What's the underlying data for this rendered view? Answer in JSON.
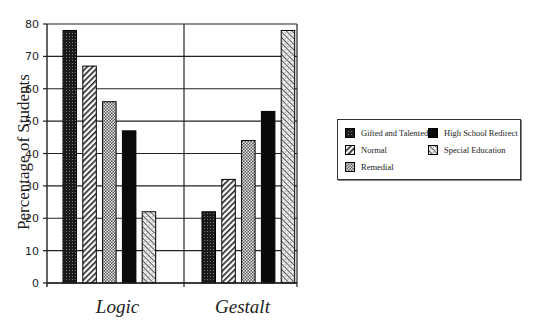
{
  "chart_data": {
    "type": "bar",
    "title": "",
    "xlabel": "",
    "ylabel": "Percentage of Students",
    "ylim": [
      0,
      80
    ],
    "yticks": [
      0,
      10,
      20,
      30,
      40,
      50,
      60,
      70,
      80
    ],
    "grid": true,
    "legend_position": "right",
    "categories": [
      "Logic",
      "Gestalt"
    ],
    "series": [
      {
        "name": "Gifted and Talented",
        "values": [
          78,
          22
        ],
        "pattern": "dark-dots"
      },
      {
        "name": "Normal",
        "values": [
          67,
          32
        ],
        "pattern": "diagonal-stripes"
      },
      {
        "name": "Remedial",
        "values": [
          56,
          44
        ],
        "pattern": "checker"
      },
      {
        "name": "High School Redirect",
        "values": [
          47,
          53
        ],
        "pattern": "solid-black"
      },
      {
        "name": "Special Education",
        "values": [
          22,
          78
        ],
        "pattern": "light-diagonal"
      }
    ]
  },
  "legend": {
    "items": [
      {
        "label": "Gifted and Talented",
        "pattern": "dark-dots"
      },
      {
        "label": "High School Redirect",
        "pattern": "solid-black"
      },
      {
        "label": "Normal",
        "pattern": "diagonal-stripes"
      },
      {
        "label": "Special Education",
        "pattern": "light-diagonal"
      },
      {
        "label": "Remedial",
        "pattern": "checker"
      }
    ]
  }
}
